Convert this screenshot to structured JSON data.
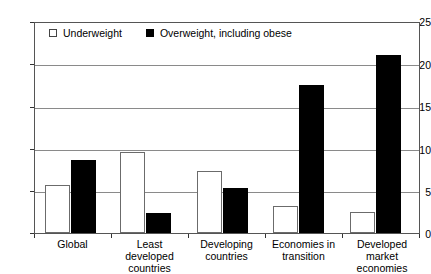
{
  "chart_data": {
    "type": "bar",
    "title": "",
    "xlabel": "",
    "ylabel": "",
    "ylim": [
      0,
      25
    ],
    "ytick_labels": [
      "0",
      "5",
      "10",
      "15",
      "20",
      "25"
    ],
    "yticks": [
      0,
      5,
      10,
      15,
      20,
      25
    ],
    "grid": true,
    "legend_position": "top-left-inside",
    "categories": [
      "Global",
      "Least developed countries",
      "Developing countries",
      "Economies in transition",
      "Developed market economies"
    ],
    "series": [
      {
        "name": "Underweight",
        "color": "#ffffff",
        "values": [
          5.7,
          9.6,
          7.3,
          3.2,
          2.5
        ]
      },
      {
        "name": "Overweight, including obese",
        "color": "#000000",
        "values": [
          8.6,
          2.4,
          5.3,
          17.5,
          21.0
        ]
      }
    ]
  },
  "legend": {
    "items": [
      {
        "label": "Underweight",
        "swatch": "light-square-icon"
      },
      {
        "label": "Overweight, including obese",
        "swatch": "dark-square-icon"
      }
    ]
  }
}
